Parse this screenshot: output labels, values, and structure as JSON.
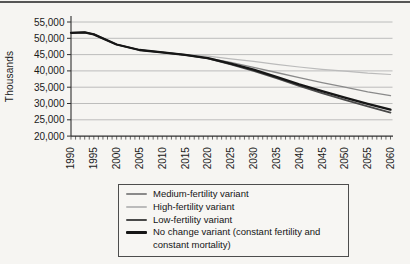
{
  "page": {
    "background": "#f6f5f2",
    "top_rule_color": "#565656"
  },
  "chart": {
    "y_axis_title": "Thousands",
    "axis_color": "#2e2e2e",
    "gridline_color": "#a9a9a9",
    "tick_label_color": "#1a1a1a",
    "y_tick_labels": [
      "55,000",
      "50,000",
      "45,000",
      "40,000",
      "35,000",
      "30,000",
      "25,000",
      "20,000"
    ],
    "x_tick_labels": [
      "1990",
      "1995",
      "2000",
      "2005",
      "2010",
      "2015",
      "2020",
      "2025",
      "2030",
      "2035",
      "2040",
      "2045",
      "2050",
      "2055",
      "2060"
    ]
  },
  "chart_data": {
    "type": "line",
    "title": "",
    "xlabel": "",
    "ylabel": "Thousands",
    "ylim": [
      20000,
      55000
    ],
    "y_tick_step": 5000,
    "xlim": [
      1990,
      2060
    ],
    "x_major_step": 5,
    "x_minor_step": 1,
    "grid": true,
    "legend_position": "bottom",
    "x": [
      1990,
      1993,
      1995,
      2000,
      2005,
      2010,
      2015,
      2020,
      2025,
      2030,
      2035,
      2040,
      2045,
      2050,
      2055,
      2060
    ],
    "series": [
      {
        "name": "Medium-fertility variant",
        "color": "#8a8a8a",
        "width": 1.3,
        "values": [
          51700,
          51800,
          51200,
          48100,
          46400,
          45700,
          44900,
          43900,
          42600,
          41100,
          39500,
          37900,
          36400,
          35000,
          33600,
          32400
        ]
      },
      {
        "name": "High-fertility variant",
        "color": "#bbbbbb",
        "width": 1.2,
        "values": [
          51700,
          51800,
          51200,
          48100,
          46400,
          45700,
          44900,
          44500,
          43700,
          42900,
          42000,
          41200,
          40500,
          39900,
          39300,
          38900
        ]
      },
      {
        "name": "Low-fertility variant",
        "color": "#4a4a4a",
        "width": 1.7,
        "values": [
          51700,
          51800,
          51200,
          48100,
          46400,
          45700,
          44900,
          43800,
          42000,
          40000,
          37800,
          35400,
          33200,
          31100,
          29100,
          27200
        ]
      },
      {
        "name": "No change variant (constant fertility and constant mortality)",
        "color": "#161616",
        "width": 2.3,
        "values": [
          51700,
          51800,
          51200,
          48100,
          46400,
          45700,
          44900,
          43900,
          42200,
          40400,
          38200,
          35900,
          33800,
          31800,
          29900,
          28100
        ]
      }
    ]
  },
  "legend": {
    "items": [
      {
        "label": "Medium-fertility variant",
        "color": "#8a8a8a",
        "weight": 2
      },
      {
        "label": "High-fertility variant",
        "color": "#bbbbbb",
        "weight": 2
      },
      {
        "label": "Low-fertility variant",
        "color": "#4a4a4a",
        "weight": 2.5
      },
      {
        "label": "No change variant (constant fertility and constant mortality)",
        "color": "#161616",
        "weight": 3
      }
    ]
  }
}
